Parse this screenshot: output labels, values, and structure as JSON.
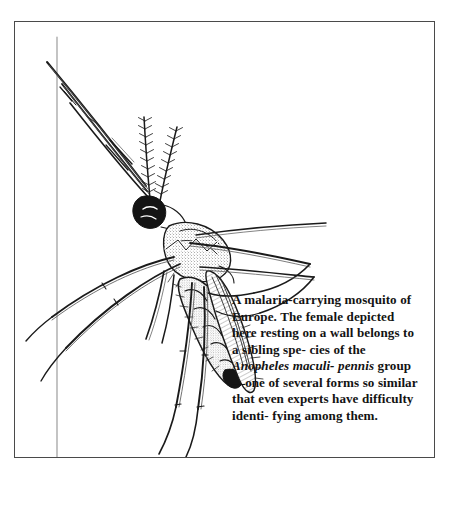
{
  "plate": {
    "background_color": "#ffffff",
    "frame_color": "#4a4a4a",
    "ink_color": "#1a1a1a"
  },
  "figure": {
    "wall_line_label": "vertical-wall-edge"
  },
  "caption": {
    "line_1": "A malaria-carrying mosquito",
    "line_2": "of Europe. The female",
    "line_3": "depicted here resting on a",
    "line_4": "wall belongs to a sibling spe-",
    "line_5_prefix": "cies of the ",
    "line_5_italic": "Anopheles maculi-",
    "line_6_italic": "pennis",
    "line_6_suffix": " group—one of several",
    "line_7": "forms so similar that even",
    "line_8": "experts have difficulty identi-",
    "line_9": "fying among them."
  }
}
